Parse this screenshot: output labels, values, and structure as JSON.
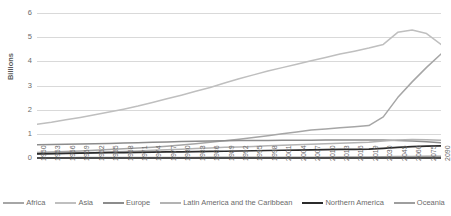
{
  "chart_data": {
    "type": "line",
    "title": "",
    "xlabel": "",
    "ylabel": "Billions",
    "ylim": [
      0,
      6
    ],
    "ytick_labels": [
      "6",
      "5",
      "4",
      "3",
      "2",
      "1",
      "0"
    ],
    "ytick_values": [
      6,
      5,
      4,
      3,
      2,
      1,
      0
    ],
    "grid": "horizontal",
    "legend_position": "bottom",
    "x": [
      1950,
      1953,
      1956,
      1959,
      1962,
      1965,
      1968,
      1971,
      1974,
      1977,
      1980,
      1983,
      1986,
      1989,
      1992,
      1995,
      1998,
      2001,
      2004,
      2007,
      2010,
      2013,
      2016,
      2019,
      2030,
      2045,
      2060,
      2075,
      2090
    ],
    "categories": [
      "1950",
      "1953",
      "1956",
      "1959",
      "1962",
      "1965",
      "1968",
      "1971",
      "1974",
      "1977",
      "1980",
      "1983",
      "1986",
      "1989",
      "1992",
      "1995",
      "1998",
      "2001",
      "2004",
      "2007",
      "2010",
      "2013",
      "2016",
      "2019",
      "2030",
      "2045",
      "2060",
      "2075",
      "2090"
    ],
    "series": [
      {
        "name": "Africa",
        "color": "#a6a6a6",
        "values": [
          0.23,
          0.25,
          0.27,
          0.29,
          0.32,
          0.35,
          0.38,
          0.41,
          0.45,
          0.49,
          0.54,
          0.59,
          0.65,
          0.71,
          0.78,
          0.85,
          0.92,
          1.0,
          1.08,
          1.16,
          1.2,
          1.25,
          1.29,
          1.34,
          1.7,
          2.5,
          3.15,
          3.75,
          4.3
        ]
      },
      {
        "name": "Asia",
        "color": "#bfbfbf",
        "values": [
          1.4,
          1.48,
          1.58,
          1.68,
          1.79,
          1.9,
          2.02,
          2.15,
          2.3,
          2.45,
          2.6,
          2.76,
          2.92,
          3.1,
          3.28,
          3.44,
          3.6,
          3.74,
          3.88,
          4.02,
          4.16,
          4.3,
          4.42,
          4.55,
          4.7,
          5.2,
          5.3,
          5.15,
          4.7
        ]
      },
      {
        "name": "Europe",
        "color": "#8c8c8c",
        "values": [
          0.55,
          0.56,
          0.57,
          0.58,
          0.59,
          0.6,
          0.62,
          0.63,
          0.65,
          0.66,
          0.68,
          0.69,
          0.7,
          0.71,
          0.72,
          0.72,
          0.72,
          0.73,
          0.73,
          0.73,
          0.74,
          0.74,
          0.74,
          0.75,
          0.74,
          0.72,
          0.7,
          0.67,
          0.63
        ]
      },
      {
        "name": "Latin America and the Caribbean",
        "color": "#b3b3b3",
        "values": [
          0.17,
          0.18,
          0.2,
          0.22,
          0.23,
          0.25,
          0.27,
          0.29,
          0.32,
          0.34,
          0.36,
          0.39,
          0.41,
          0.44,
          0.46,
          0.48,
          0.51,
          0.53,
          0.55,
          0.57,
          0.59,
          0.61,
          0.63,
          0.65,
          0.7,
          0.75,
          0.77,
          0.76,
          0.73
        ]
      },
      {
        "name": "Northern America",
        "color": "#2b2b2b",
        "values": [
          0.17,
          0.18,
          0.19,
          0.2,
          0.21,
          0.22,
          0.22,
          0.23,
          0.24,
          0.25,
          0.25,
          0.26,
          0.27,
          0.28,
          0.29,
          0.3,
          0.31,
          0.32,
          0.33,
          0.34,
          0.35,
          0.36,
          0.36,
          0.37,
          0.4,
          0.44,
          0.47,
          0.49,
          0.5
        ]
      },
      {
        "name": "Oceania",
        "color": "#9e9e9e",
        "values": [
          0.013,
          0.014,
          0.015,
          0.016,
          0.017,
          0.018,
          0.019,
          0.02,
          0.021,
          0.022,
          0.023,
          0.025,
          0.026,
          0.027,
          0.028,
          0.029,
          0.03,
          0.031,
          0.033,
          0.034,
          0.036,
          0.038,
          0.04,
          0.042,
          0.048,
          0.057,
          0.063,
          0.068,
          0.072
        ]
      }
    ]
  }
}
